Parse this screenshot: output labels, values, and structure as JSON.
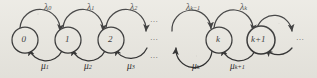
{
  "figure": {
    "type": "state-transition-diagram",
    "background_color": "#e9e7e0",
    "stroke_color": "#2b2b2b",
    "states": [
      {
        "id": "s0",
        "label": "0",
        "sub": "",
        "cx": 25,
        "cy": 40,
        "r": 13
      },
      {
        "id": "s1",
        "label": "1",
        "sub": "",
        "cx": 68,
        "cy": 40,
        "r": 13
      },
      {
        "id": "s2",
        "label": "2",
        "sub": "",
        "cx": 111,
        "cy": 40,
        "r": 13
      },
      {
        "id": "sk",
        "label": "k",
        "sub": "",
        "cx": 219,
        "cy": 40,
        "r": 13
      },
      {
        "id": "sk1",
        "label": "k",
        "sub": "+1",
        "cx": 261,
        "cy": 40,
        "r": 14
      }
    ],
    "birth_rates": [
      {
        "symbol": "λ",
        "sub": "0",
        "x": 44,
        "y": 3
      },
      {
        "symbol": "λ",
        "sub": "1",
        "x": 87,
        "y": 3
      },
      {
        "symbol": "λ",
        "sub": "2",
        "x": 130,
        "y": 3
      },
      {
        "symbol": "λ",
        "sub": "k−1",
        "x": 190,
        "y": 3
      },
      {
        "symbol": "λ",
        "sub": "k",
        "x": 240,
        "y": 3
      }
    ],
    "death_rates": [
      {
        "symbol": "μ",
        "sub": "1",
        "x": 41,
        "y": 62
      },
      {
        "symbol": "μ",
        "sub": "2",
        "x": 84,
        "y": 62
      },
      {
        "symbol": "μ",
        "sub": "3",
        "x": 127,
        "y": 62
      },
      {
        "symbol": "μ",
        "sub": "k",
        "x": 192,
        "y": 62
      },
      {
        "symbol": "μ",
        "sub": "k+1",
        "x": 232,
        "y": 62
      }
    ],
    "ellipses": [
      {
        "id": "mid-top",
        "text": "…",
        "x": 152,
        "y": 20
      },
      {
        "id": "mid-center",
        "text": "…",
        "x": 152,
        "y": 37
      },
      {
        "id": "mid-bottom",
        "text": "…",
        "x": 152,
        "y": 54
      },
      {
        "id": "right-end",
        "text": "…",
        "x": 296,
        "y": 37
      }
    ]
  }
}
